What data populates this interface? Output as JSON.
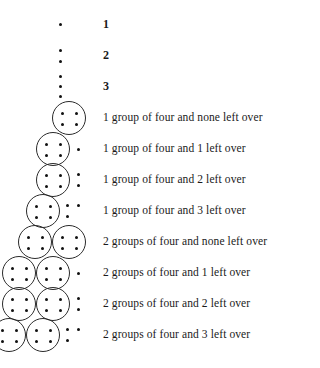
{
  "figure": {
    "kind": "grouping-by-four-pictogram",
    "dot_color": "#111111",
    "circle_color": "#2b2b2b",
    "background": "#ffffff",
    "group_size": 4,
    "rows": [
      {
        "id": "row-1",
        "groups": 0,
        "leftovers": 1,
        "loose_stack": true,
        "caption": "1",
        "caption_style": "numeral"
      },
      {
        "id": "row-2",
        "groups": 0,
        "leftovers": 2,
        "loose_stack": true,
        "caption": "2",
        "caption_style": "numeral"
      },
      {
        "id": "row-3",
        "groups": 0,
        "leftovers": 3,
        "loose_stack": true,
        "caption": "3",
        "caption_style": "numeral"
      },
      {
        "id": "row-4",
        "groups": 1,
        "leftovers": 0,
        "loose_stack": false,
        "caption": "1 group of four and none left over",
        "caption_style": "text"
      },
      {
        "id": "row-5",
        "groups": 1,
        "leftovers": 1,
        "loose_stack": false,
        "caption": "1 group of four and 1 left over",
        "caption_style": "text"
      },
      {
        "id": "row-6",
        "groups": 1,
        "leftovers": 2,
        "loose_stack": false,
        "caption": "1 group of four and 2 left over",
        "caption_style": "text"
      },
      {
        "id": "row-7",
        "groups": 1,
        "leftovers": 3,
        "loose_stack": false,
        "caption": "1 group of four and 3 left over",
        "caption_style": "text"
      },
      {
        "id": "row-8",
        "groups": 2,
        "leftovers": 0,
        "loose_stack": false,
        "caption": "2 groups of four and none left over",
        "caption_style": "text"
      },
      {
        "id": "row-9",
        "groups": 2,
        "leftovers": 1,
        "loose_stack": false,
        "caption": "2 groups of four and 1 left over",
        "caption_style": "text"
      },
      {
        "id": "row-10",
        "groups": 2,
        "leftovers": 2,
        "loose_stack": false,
        "caption": "2 groups of four and 2 left over",
        "caption_style": "text"
      },
      {
        "id": "row-11",
        "groups": 2,
        "leftovers": 3,
        "loose_stack": false,
        "caption": "2 groups of four and 3 left over",
        "caption_style": "text"
      }
    ]
  }
}
